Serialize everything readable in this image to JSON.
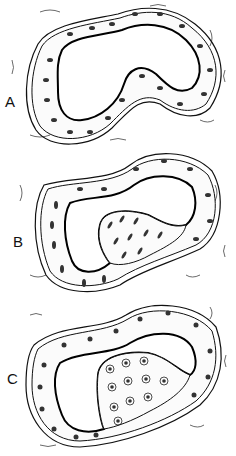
{
  "figure": {
    "panels": [
      {
        "id": "A",
        "label": "A",
        "description": "Duct lined by regular single-layer epithelium; open lumen"
      },
      {
        "id": "B",
        "label": "B",
        "description": "Duct with focal proliferation of elongated cells projecting into lumen"
      },
      {
        "id": "C",
        "label": "C",
        "description": "Duct with larger mass of proliferating rounded cells filling much of lumen"
      }
    ],
    "colors": {
      "ink": "#111111",
      "background": "#ffffff"
    }
  }
}
